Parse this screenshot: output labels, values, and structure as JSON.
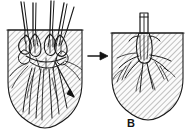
{
  "figure": {
    "label": "B",
    "caption_label": "B",
    "panel_count": 2,
    "background_color": "#ffffff",
    "ink_color": "#1a1a1a",
    "soil_hatch_color": "#8d8d8d",
    "soil_tint_color": "#f2f2f2"
  },
  "panels": [
    {
      "id": "before",
      "name": "left-panel",
      "description": "Clump of bulbs with multiple stems in hatched soil",
      "soil_line_y": 30,
      "stem_count": 5,
      "bulb_count": 6,
      "has_pointer_arrow": true,
      "pointer_arrow_direction": "down-right"
    },
    {
      "id": "after",
      "name": "right-panel",
      "description": "Single trimmed stem with fibrous roots in hatched soil",
      "soil_line_y": 33,
      "stem_count": 1,
      "bulb_count": 1,
      "has_pointer_arrow": false,
      "label": "B"
    }
  ],
  "connector": {
    "name": "transition-arrow",
    "direction": "right",
    "symbol": "arrow-right"
  }
}
